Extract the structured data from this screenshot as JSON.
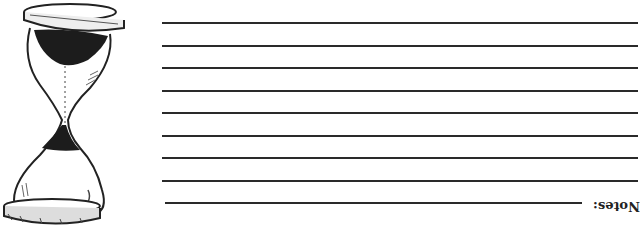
{
  "page": {
    "notes_label": "Notes:",
    "line_color": "#2a2a2a",
    "lines": [
      {
        "y": 22,
        "x1": 162,
        "x2": 638
      },
      {
        "y": 45,
        "x1": 162,
        "x2": 638
      },
      {
        "y": 67,
        "x1": 162,
        "x2": 638
      },
      {
        "y": 90,
        "x1": 162,
        "x2": 638
      },
      {
        "y": 112,
        "x1": 162,
        "x2": 638
      },
      {
        "y": 135,
        "x1": 162,
        "x2": 638
      },
      {
        "y": 157,
        "x1": 162,
        "x2": 638
      },
      {
        "y": 180,
        "x1": 162,
        "x2": 638
      },
      {
        "y": 202,
        "x1": 165,
        "x2": 582
      }
    ],
    "illustration": "hourglass-icon"
  }
}
